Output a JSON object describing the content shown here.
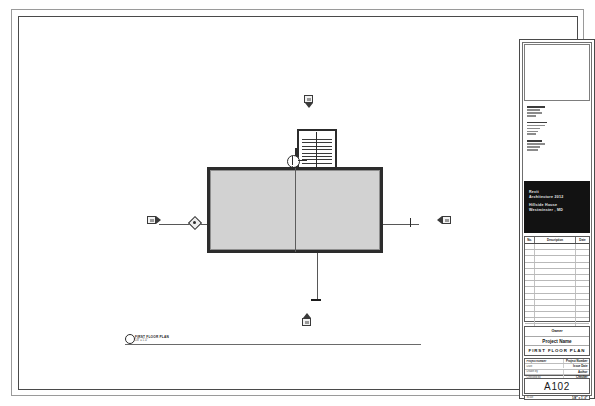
{
  "sheet": {
    "sheet_number": "A102",
    "branding": {
      "line1": "Revit",
      "line2": "Architecture 2012",
      "line3": "Hillside House",
      "line4": "Westminster , MD"
    },
    "owner_label": "Owner",
    "project_name": "Project Name",
    "sheet_title": "FIRST FLOOR PLAN",
    "revision_table": {
      "headers": [
        "No.",
        "Description",
        "Date"
      ],
      "rows": [
        {
          "no": "",
          "description": "",
          "date": ""
        },
        {
          "no": "",
          "description": "",
          "date": ""
        },
        {
          "no": "",
          "description": "",
          "date": ""
        },
        {
          "no": "",
          "description": "",
          "date": ""
        },
        {
          "no": "",
          "description": "",
          "date": ""
        },
        {
          "no": "",
          "description": "",
          "date": ""
        },
        {
          "no": "",
          "description": "",
          "date": ""
        },
        {
          "no": "",
          "description": "",
          "date": ""
        },
        {
          "no": "",
          "description": "",
          "date": ""
        },
        {
          "no": "",
          "description": "",
          "date": ""
        },
        {
          "no": "",
          "description": "",
          "date": ""
        },
        {
          "no": "",
          "description": "",
          "date": ""
        },
        {
          "no": "",
          "description": "",
          "date": ""
        },
        {
          "no": "",
          "description": "",
          "date": ""
        }
      ]
    },
    "project_data": [
      {
        "key": "Project number",
        "value": "Project Number"
      },
      {
        "key": "Date",
        "value": "Issue Date"
      },
      {
        "key": "Drawn by",
        "value": "Author"
      },
      {
        "key": "Checked by",
        "value": "Checker"
      }
    ],
    "scale_row": {
      "key": "Scale",
      "value": "1/8\" = 1'-0\""
    }
  },
  "drawing": {
    "view_title": "FIRST FLOOR PLAN",
    "view_scale": "1/8\" = 1'-0\"",
    "elevation_markers": [
      {
        "name": "elevation-marker-north",
        "position": "top",
        "direction": "down"
      },
      {
        "name": "elevation-marker-west",
        "position": "left",
        "direction": "right"
      },
      {
        "name": "elevation-marker-east",
        "position": "right",
        "direction": "left"
      },
      {
        "name": "elevation-marker-south",
        "position": "bottom",
        "direction": "up"
      }
    ],
    "section_marker": "section-head-west",
    "callout_marker": "stair-callout"
  }
}
